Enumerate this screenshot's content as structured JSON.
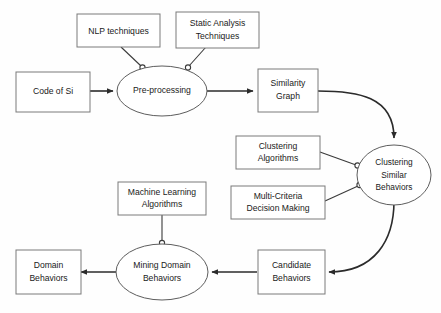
{
  "diagram": {
    "type": "flowchart",
    "colors": {
      "background": "#fefefe",
      "box_stroke": "#7a7a7a",
      "ellipse_stroke": "#5d5d5d",
      "arrow": "#2b2b2b",
      "text": "#1a1a1a"
    },
    "nodes": [
      {
        "id": "nlp",
        "shape": "box",
        "label_lines": [
          "NLP techniques"
        ]
      },
      {
        "id": "static",
        "shape": "box",
        "label_lines": [
          "Static Analysis",
          "Techniques"
        ]
      },
      {
        "id": "code",
        "shape": "box",
        "label_lines": [
          "Code of Si"
        ]
      },
      {
        "id": "preprocessing",
        "shape": "ellipse",
        "label_lines": [
          "Pre-processing"
        ]
      },
      {
        "id": "simgraph",
        "shape": "box",
        "label_lines": [
          "Similarity",
          "Graph"
        ]
      },
      {
        "id": "clusteralg",
        "shape": "box",
        "label_lines": [
          "Clustering",
          "Algorithms"
        ]
      },
      {
        "id": "clustersim",
        "shape": "ellipse",
        "label_lines": [
          "Clustering",
          "Similar",
          "Behaviors"
        ]
      },
      {
        "id": "mcdm",
        "shape": "box",
        "label_lines": [
          "Multi-Criteria",
          "Decision Making"
        ]
      },
      {
        "id": "mlalg",
        "shape": "box",
        "label_lines": [
          "Machine Learning",
          "Algorithms"
        ]
      },
      {
        "id": "candidate",
        "shape": "box",
        "label_lines": [
          "Candidate",
          "Behaviors"
        ]
      },
      {
        "id": "mining",
        "shape": "ellipse",
        "label_lines": [
          "Mining Domain",
          "Behaviors"
        ]
      },
      {
        "id": "domain",
        "shape": "box",
        "label_lines": [
          "Domain",
          "Behaviors"
        ]
      }
    ],
    "edges": [
      {
        "from": "code",
        "to": "preprocessing",
        "style": "arrow"
      },
      {
        "from": "nlp",
        "to": "preprocessing",
        "style": "connector-dot"
      },
      {
        "from": "static",
        "to": "preprocessing",
        "style": "connector-dot"
      },
      {
        "from": "preprocessing",
        "to": "simgraph",
        "style": "arrow"
      },
      {
        "from": "simgraph",
        "to": "clustersim",
        "style": "arrow-curved"
      },
      {
        "from": "clusteralg",
        "to": "clustersim",
        "style": "connector-dot"
      },
      {
        "from": "mcdm",
        "to": "clustersim",
        "style": "connector-dot"
      },
      {
        "from": "clustersim",
        "to": "candidate",
        "style": "arrow-curved"
      },
      {
        "from": "candidate",
        "to": "mining",
        "style": "arrow"
      },
      {
        "from": "mlalg",
        "to": "mining",
        "style": "connector-dot"
      },
      {
        "from": "mining",
        "to": "domain",
        "style": "arrow"
      }
    ],
    "labels": {
      "nlp_l1": "NLP techniques",
      "static_l1": "Static Analysis",
      "static_l2": "Techniques",
      "code_l1": "Code of Si",
      "preprocessing_l1": "Pre-processing",
      "simgraph_l1": "Similarity",
      "simgraph_l2": "Graph",
      "clusteralg_l1": "Clustering",
      "clusteralg_l2": "Algorithms",
      "clustersim_l1": "Clustering",
      "clustersim_l2": "Similar",
      "clustersim_l3": "Behaviors",
      "mcdm_l1": "Multi-Criteria",
      "mcdm_l2": "Decision Making",
      "mlalg_l1": "Machine Learning",
      "mlalg_l2": "Algorithms",
      "candidate_l1": "Candidate",
      "candidate_l2": "Behaviors",
      "mining_l1": "Mining Domain",
      "mining_l2": "Behaviors",
      "domain_l1": "Domain",
      "domain_l2": "Behaviors"
    }
  }
}
